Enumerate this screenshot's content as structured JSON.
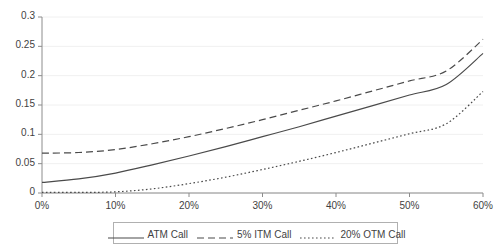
{
  "chart_data": {
    "type": "line",
    "title": "",
    "xlabel": "",
    "ylabel": "",
    "xlim": [
      0,
      0.6
    ],
    "ylim": [
      0,
      0.3
    ],
    "grid": true,
    "legend_position": "bottom",
    "x_tick_labels": [
      "0%",
      "10%",
      "20%",
      "30%",
      "40%",
      "50%",
      "60%"
    ],
    "x_tick_values": [
      0,
      0.1,
      0.2,
      0.3,
      0.4,
      0.5,
      0.6
    ],
    "y_tick_labels": [
      "0",
      "0.05",
      "0.1",
      "0.15",
      "0.2",
      "0.25",
      "0.3"
    ],
    "y_tick_values": [
      0,
      0.05,
      0.1,
      0.15,
      0.2,
      0.25,
      0.3
    ],
    "x": [
      0,
      0.05,
      0.1,
      0.15,
      0.2,
      0.25,
      0.3,
      0.35,
      0.4,
      0.45,
      0.5,
      0.55,
      0.6
    ],
    "series": [
      {
        "name": "ATM Call",
        "style": "solid",
        "color": "#4a4a4a",
        "values": [
          0.018,
          0.024,
          0.034,
          0.048,
          0.063,
          0.079,
          0.096,
          0.113,
          0.131,
          0.149,
          0.167,
          0.185,
          0.238
        ]
      },
      {
        "name": "5% ITM Call",
        "style": "dashed",
        "color": "#4a4a4a",
        "values": [
          0.068,
          0.069,
          0.074,
          0.084,
          0.096,
          0.11,
          0.125,
          0.141,
          0.157,
          0.174,
          0.191,
          0.208,
          0.262
        ]
      },
      {
        "name": "20% OTM Call",
        "style": "dotted",
        "color": "#4a4a4a",
        "values": [
          0.001,
          0.001,
          0.002,
          0.007,
          0.016,
          0.027,
          0.04,
          0.054,
          0.069,
          0.085,
          0.101,
          0.118,
          0.173
        ]
      }
    ]
  },
  "legend": {
    "items": [
      {
        "label": "ATM Call",
        "style": "solid"
      },
      {
        "label": "5% ITM Call",
        "style": "dashed"
      },
      {
        "label": "20% OTM Call",
        "style": "dotted"
      }
    ]
  },
  "colors": {
    "line": "#4a4a4a",
    "axis": "#8c8c8c",
    "grid": "#f0f0f0",
    "text": "#3f3f3f",
    "legend_border": "#b0b0b0"
  }
}
